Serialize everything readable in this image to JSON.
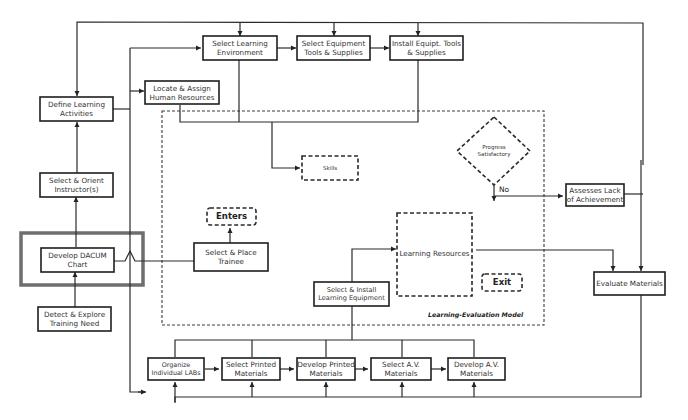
{
  "diagram": {
    "title": "Learning-Evaluation Model",
    "nodes": {
      "define_learning_activities": "Define Learning Activities",
      "select_orient_instructors": "Select & Orient Instructor(s)",
      "develop_dacum_chart": "Develop DACUM Chart",
      "detect_explore_need": "Detect & Explore Training Need",
      "select_learning_environment": "Select Learning Environment",
      "select_equipment_tools": "Select Equipment Tools & Supplies",
      "install_equipment_tools": "Install Equipt. Tools & Supplies",
      "locate_assign_hr": "Locate & Assign Human Resources",
      "skills": "Skills",
      "enters": "Enters",
      "select_place_trainee": "Select & Place Trainee",
      "progress_satisfactory": "Progress Satisfactory",
      "no_label": "No",
      "assesses_lack": "Assesses Lack of Achievement",
      "learning_resources": "Learning Resources",
      "exit": "Exit",
      "select_install_equipment": "Select & Install Learning Equipment",
      "evaluate_materials": "Evaluate Materials",
      "organize_labs": "Organize Individual LABs",
      "select_printed": "Select Printed Materials",
      "develop_printed": "Develop Printed Materials",
      "select_av": "Select A.V. Materials",
      "develop_av": "Develop A.V. Materials"
    },
    "colors": {
      "line": "#2a2a2a",
      "highlight_frame": "#6e6e6e",
      "background": "#ffffff"
    }
  }
}
